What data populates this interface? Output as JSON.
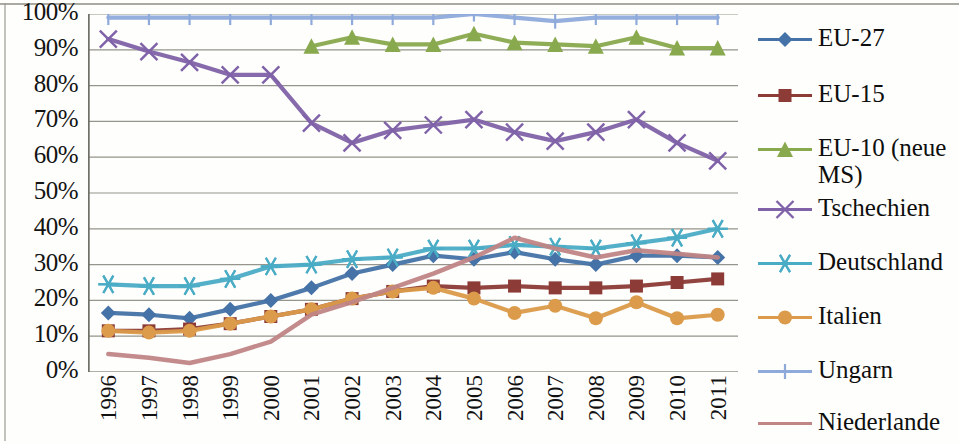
{
  "chart_data": {
    "type": "line",
    "title": "",
    "xlabel": "",
    "ylabel": "",
    "ylim": [
      0,
      100
    ],
    "y_tick_labels": [
      "100%",
      "90%",
      "80%",
      "70%",
      "60%",
      "50%",
      "40%",
      "30%",
      "20%",
      "10%",
      "0%"
    ],
    "y_ticks": [
      100,
      90,
      80,
      70,
      60,
      50,
      40,
      30,
      20,
      10,
      0
    ],
    "grid": true,
    "legend_position": "right",
    "categories": [
      "1996",
      "1997",
      "1998",
      "1999",
      "2000",
      "2001",
      "2002",
      "2003",
      "2004",
      "2005",
      "2006",
      "2007",
      "2008",
      "2009",
      "2010",
      "2011"
    ],
    "series": [
      {
        "name": "EU-27",
        "color": "#4572a7",
        "marker": "diamond",
        "values": [
          16.5,
          16.0,
          15.0,
          17.5,
          20.0,
          23.5,
          27.5,
          30.0,
          32.5,
          31.5,
          33.5,
          31.5,
          30.0,
          32.5,
          32.5,
          32.0
        ]
      },
      {
        "name": "EU-15",
        "color": "#8c3b36",
        "marker": "square",
        "values": [
          11.5,
          11.5,
          12.0,
          13.5,
          15.5,
          17.5,
          20.5,
          22.5,
          24.0,
          23.5,
          24.0,
          23.5,
          23.5,
          24.0,
          25.0,
          26.0
        ]
      },
      {
        "name": "EU-10 (neue MS)",
        "color": "#88a94d",
        "marker": "triangle",
        "values": [
          null,
          null,
          null,
          null,
          null,
          91.0,
          93.5,
          91.5,
          91.5,
          94.5,
          92.0,
          91.5,
          91.0,
          93.5,
          90.5,
          90.5
        ]
      },
      {
        "name": "Tschechien",
        "color": "#7f62a8",
        "marker": "x",
        "values": [
          93.0,
          89.5,
          86.5,
          83.0,
          83.0,
          69.5,
          64.0,
          67.5,
          69.0,
          70.5,
          67.0,
          64.5,
          67.0,
          70.5,
          64.0,
          59.0
        ]
      },
      {
        "name": "Deutschland",
        "color": "#4aacc5",
        "marker": "asterisk",
        "values": [
          24.5,
          24.0,
          24.0,
          26.0,
          29.5,
          30.0,
          31.5,
          32.0,
          34.5,
          34.5,
          35.5,
          35.0,
          34.5,
          36.0,
          37.5,
          40.0
        ]
      },
      {
        "name": "Italien",
        "color": "#db9b4a",
        "marker": "circle",
        "values": [
          11.5,
          11.0,
          11.5,
          13.5,
          15.5,
          17.5,
          20.5,
          22.5,
          23.5,
          20.5,
          16.5,
          18.5,
          15.0,
          19.5,
          15.0,
          16.0
        ]
      },
      {
        "name": "Ungarn",
        "color": "#8eaadb",
        "marker": "plus",
        "values": [
          99.0,
          99.0,
          99.0,
          99.0,
          99.0,
          99.0,
          99.0,
          99.0,
          99.0,
          100.0,
          99.0,
          98.0,
          99.0,
          99.0,
          99.0,
          99.0
        ]
      },
      {
        "name": "Niederlande",
        "color": "#c08585",
        "marker": "none",
        "values": [
          5.0,
          4.0,
          2.5,
          5.0,
          8.5,
          16.0,
          19.5,
          23.5,
          27.5,
          32.0,
          37.5,
          34.5,
          32.0,
          34.0,
          33.0,
          32.0
        ]
      }
    ]
  },
  "legend": {
    "items": [
      {
        "label": "EU-27"
      },
      {
        "label": "EU-15"
      },
      {
        "label": "EU-10 (neue\nMS)"
      },
      {
        "label": "Tschechien"
      },
      {
        "label": "Deutschland"
      },
      {
        "label": "Italien"
      },
      {
        "label": "Ungarn"
      },
      {
        "label": "Niederlande"
      }
    ]
  }
}
